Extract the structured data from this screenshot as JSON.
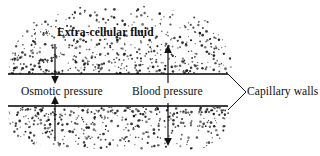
{
  "figure": {
    "background_color": "#ffffff",
    "ink_color": "#000000"
  },
  "labels": {
    "extracellular_fluid": "Extra-cellular fluid",
    "osmotic_pressure": "Osmotic pressure",
    "blood_pressure": "Blood pressure",
    "capillary_walls": "Capillary walls"
  },
  "structures": {
    "capillary_wall_top": {
      "name": "upper capillary wall",
      "x1": 8,
      "y1": 74,
      "x2": 228,
      "y2": 74
    },
    "capillary_wall_bottom": {
      "name": "lower capillary wall",
      "x1": 8,
      "y1": 106,
      "x2": 228,
      "y2": 106
    },
    "leader_line_upper": {
      "x1": 228,
      "y1": 74,
      "x2": 246,
      "y2": 92
    },
    "leader_line_lower": {
      "x1": 228,
      "y1": 110,
      "x2": 246,
      "y2": 92
    }
  },
  "arrows": [
    {
      "name": "osmotic-pressure-arrow-upper",
      "direction": "down",
      "x": 55,
      "y_start": 44,
      "y_end": 83
    },
    {
      "name": "blood-pressure-arrow-upper",
      "direction": "up",
      "x": 168,
      "y_start": 83,
      "y_end": 46
    },
    {
      "name": "osmotic-pressure-arrow-lower",
      "direction": "up",
      "x": 55,
      "y_start": 140,
      "y_end": 97
    },
    {
      "name": "blood-pressure-arrow-lower",
      "direction": "down",
      "x": 168,
      "y_start": 103,
      "y_end": 146
    }
  ],
  "stipple_fields": [
    {
      "name": "extra-cellular-fluid-stipple-upper",
      "description": "dome shaped speckled region above the upper capillary wall",
      "x_min": 8,
      "x_max": 232,
      "y_min": 6,
      "y_max": 74,
      "dot_count": 560
    },
    {
      "name": "extra-cellular-fluid-stipple-lower",
      "description": "speckled region below the lower capillary wall, fading downward",
      "x_min": 8,
      "x_max": 230,
      "y_min": 107,
      "y_max": 150,
      "dot_count": 430
    }
  ]
}
